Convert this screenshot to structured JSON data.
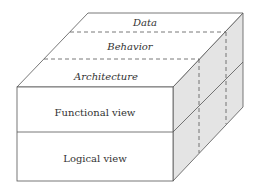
{
  "diagram": {
    "top_face_labels": [
      "Data",
      "Behavior",
      "Architecture"
    ],
    "front_face_labels": [
      "Functional view",
      "Logical view"
    ],
    "colors": {
      "stroke": "#555555",
      "side_fill": "#e4e4e4",
      "face_fill": "#ffffff",
      "text": "#333333"
    }
  }
}
